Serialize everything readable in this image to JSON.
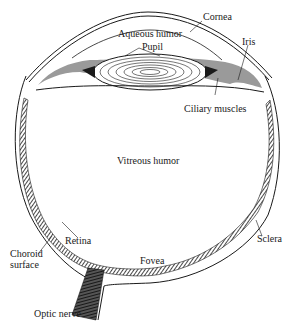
{
  "figure": {
    "colors": {
      "ink": "#1a1a1a",
      "iris_fill": "#9a9a9a",
      "background": "#ffffff"
    },
    "labels": {
      "cornea": "Cornea",
      "aqueous_humor": "Aqueous humor",
      "pupil": "Pupil",
      "iris": "Iris",
      "ciliary_muscles": "Ciliary muscles",
      "vitreous_humor": "Vitreous humor",
      "retina": "Retina",
      "choroid_line1": "Choroid",
      "choroid_line2": "surface",
      "sclera": "Sclera",
      "fovea": "Fovea",
      "optic_nerve": "Optic nerve"
    }
  }
}
